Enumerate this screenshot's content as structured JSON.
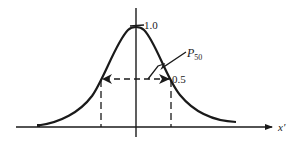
{
  "diagram": {
    "type": "gaussian-pulse-width",
    "labels": {
      "peak": "1.0",
      "half": "0.5",
      "width_symbol": "P",
      "width_subscript": "50",
      "x_axis": "x′"
    },
    "colors": {
      "stroke": "#1a1a1a",
      "background": "#ffffff"
    }
  }
}
